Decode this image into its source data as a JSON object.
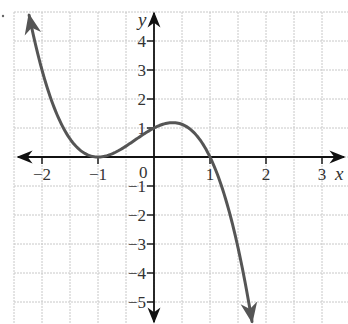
{
  "chart_data": {
    "type": "line",
    "title": "",
    "xlabel": "x",
    "ylabel": "y",
    "function": "f(x) = -(x+1)^2 (x-1)",
    "xlim": [
      -2.5,
      3.4
    ],
    "ylim": [
      -5.6,
      5.0
    ],
    "grid": true,
    "grid_step_x": 0.5,
    "grid_step_y": 1,
    "x_ticks": [
      -2,
      -1,
      1,
      2,
      3
    ],
    "x_tick_labels": [
      "−2",
      "−1",
      "1",
      "2",
      "3"
    ],
    "y_ticks": [
      4,
      3,
      2,
      1,
      -1,
      -2,
      -3,
      -4,
      -5
    ],
    "y_tick_labels": [
      "4",
      "3",
      "2",
      "1",
      "−1",
      "−2",
      "−3",
      "−4",
      "−5"
    ],
    "origin_label": "0",
    "series": [
      {
        "name": "curve",
        "x": [
          -2.23,
          -2,
          -1.5,
          -1,
          -0.5,
          0,
          0.333,
          0.5,
          1,
          1.25,
          1.5,
          1.75
        ],
        "y": [
          4.89,
          3.0,
          0.63,
          0.0,
          0.38,
          1.0,
          1.19,
          1.13,
          0.0,
          -1.27,
          -3.13,
          -5.67
        ]
      }
    ],
    "key_points": [
      {
        "label": "double root",
        "x": -1,
        "y": 0
      },
      {
        "label": "y-intercept",
        "x": 0,
        "y": 1
      },
      {
        "label": "local max",
        "x": 0.333,
        "y": 1.19
      },
      {
        "label": "root",
        "x": 1,
        "y": 0
      }
    ],
    "end_behavior": "arrows at both ends: up-left, down-right",
    "colors": {
      "curve": "#555555",
      "axes": "#111111",
      "grid": "#c8c8c8"
    }
  }
}
